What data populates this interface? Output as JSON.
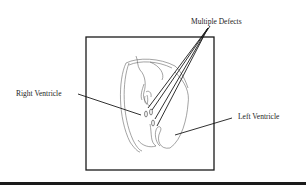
{
  "figure": {
    "labels": {
      "multiple_defects": "Multiple Defects",
      "right_ventricle": "Right Ventricle",
      "left_ventricle": "Left Ventricle"
    },
    "colors": {
      "line": "#1a1a1a",
      "sketch": "#555555",
      "background": "#ffffff"
    }
  }
}
